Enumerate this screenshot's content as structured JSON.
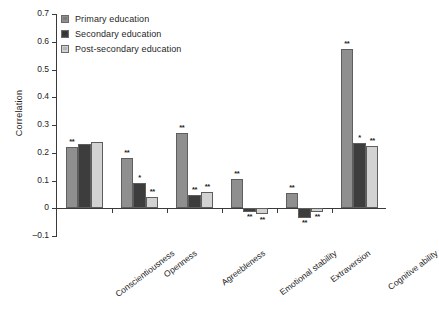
{
  "chart_data": {
    "type": "bar",
    "title": "",
    "xlabel": "",
    "ylabel": "Correlation",
    "ylim": [
      -0.1,
      0.7
    ],
    "yticks": [
      0.7,
      0.6,
      0.5,
      0.4,
      0.3,
      0.2,
      0.1,
      0,
      -0.1
    ],
    "ytick_labels": [
      "0.7",
      "0.6",
      "0.5",
      "0.4",
      "0.3",
      "0.2",
      "0.1",
      "0",
      "–0.1"
    ],
    "grid": false,
    "legend_position": "top-left",
    "categories": [
      "Conscientiousness",
      "Openness",
      "Agreebleness",
      "Emotional stability",
      "Extraversion",
      "Cognitive ability"
    ],
    "series": [
      {
        "name": "Primary education",
        "color": "#8f8f8f",
        "values": [
          0.22,
          0.18,
          0.27,
          0.105,
          0.055,
          0.575
        ],
        "significance": [
          "**",
          "**",
          "**",
          "**",
          "**",
          "**"
        ]
      },
      {
        "name": "Secondary education",
        "color": "#3d3d3d",
        "values": [
          0.23,
          0.09,
          0.048,
          -0.012,
          -0.035,
          0.235
        ],
        "significance": [
          "",
          "*",
          "**",
          "**",
          "**",
          "*"
        ]
      },
      {
        "name": "Post-secondary education",
        "color": "#d2d2d2",
        "values": [
          0.24,
          0.04,
          0.06,
          -0.022,
          -0.012,
          0.225
        ],
        "significance": [
          "",
          "**",
          "**",
          "**",
          "**",
          "**"
        ]
      }
    ]
  },
  "legend": {
    "items": [
      {
        "label": "Primary education",
        "color": "#8f8f8f"
      },
      {
        "label": "Secondary education",
        "color": "#3d3d3d"
      },
      {
        "label": "Post-secondary education",
        "color": "#d2d2d2"
      }
    ]
  },
  "axis": {
    "y_title": "Correlation"
  }
}
